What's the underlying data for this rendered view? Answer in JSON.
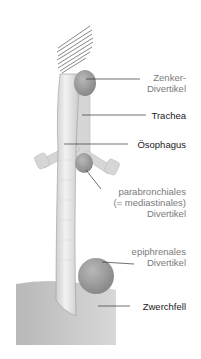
{
  "figure": {
    "colors": {
      "background": "#ffffff",
      "esophagus": "#e6e6e6",
      "diverticulum": "#9a9a9a",
      "diaphragm": "#c4c4c4",
      "bronchi": "#d2d2d2",
      "label_dark": "#1a1a1a",
      "label_gray": "#7a7a7a"
    },
    "labels": [
      {
        "id": "zenker",
        "line1": "Zenker-",
        "line2": "Divertikel"
      },
      {
        "id": "trachea",
        "line1": "Trachea"
      },
      {
        "id": "oesophagus",
        "line1": "Ösophagus"
      },
      {
        "id": "parabronchial",
        "line1": "parabronchiales",
        "line2": "(= mediastinales)",
        "line3": "Divertikel"
      },
      {
        "id": "epiphrenal",
        "line1": "epiphrenales",
        "line2": "Divertikel"
      },
      {
        "id": "zwerchfell",
        "line1": "Zwerchfell"
      }
    ]
  }
}
